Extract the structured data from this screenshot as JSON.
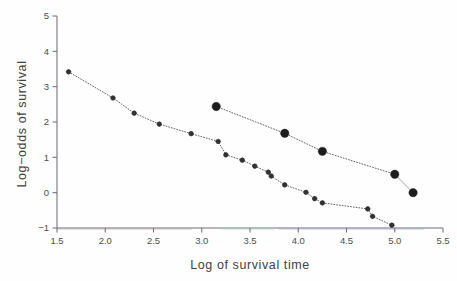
{
  "figure": {
    "background_color": "#fefefe",
    "axis_color": "#6f6f77",
    "marker_color": "#1e1e1e",
    "line_color": "#5a5a5a"
  },
  "ghost": {
    "header_text": "",
    "page_number": ""
  },
  "chart_data": {
    "type": "line",
    "title": "",
    "subtitle": "",
    "xlabel": "Log of survival time",
    "ylabel": "Log−odds of survival",
    "xlim": [
      1.5,
      5.5
    ],
    "ylim": [
      -1,
      5
    ],
    "xticks": [
      1.5,
      2.0,
      2.5,
      3.0,
      3.5,
      4.0,
      4.5,
      5.0,
      5.5
    ],
    "xticklabels": [
      "1.5",
      "2.0",
      "2.5",
      "3.0",
      "3.5",
      "4.0",
      "4.5",
      "5.0",
      "5.5"
    ],
    "yticks": [
      -1,
      0,
      1,
      2,
      3,
      4,
      5
    ],
    "yticklabels": [
      "−1",
      "0",
      "1",
      "2",
      "3",
      "4",
      "5"
    ],
    "grid": false,
    "legend": false,
    "legend_position": "none",
    "linestyle": "dotted",
    "series": [
      {
        "name": "upper",
        "marker": "filled-circle-large",
        "marker_size": 4.2,
        "x": [
          3.15,
          3.86,
          4.25,
          5.0,
          5.19
        ],
        "y": [
          2.44,
          1.68,
          1.17,
          0.52,
          0.0
        ]
      },
      {
        "name": "lower",
        "marker": "filled-circle-small",
        "marker_size": 2.3,
        "x": [
          1.62,
          2.08,
          2.3,
          2.56,
          2.89,
          3.17,
          3.25,
          3.42,
          3.55,
          3.69,
          3.72,
          3.86,
          4.08,
          4.17,
          4.25,
          4.72,
          4.77,
          4.97
        ],
        "y": [
          3.42,
          2.68,
          2.25,
          1.94,
          1.67,
          1.45,
          1.07,
          0.92,
          0.75,
          0.58,
          0.47,
          0.22,
          0.01,
          -0.17,
          -0.29,
          -0.46,
          -0.67,
          -0.92
        ]
      }
    ]
  }
}
